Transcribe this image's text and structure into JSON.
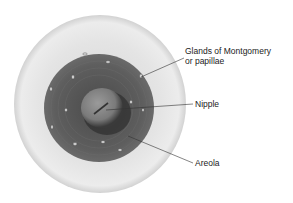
{
  "diagram": {
    "type": "anatomical-illustration",
    "labels": [
      {
        "id": "glands",
        "line1": "Glands of Montgomery",
        "line2": "or papillae"
      },
      {
        "id": "nipple",
        "text": "Nipple"
      },
      {
        "id": "areola",
        "text": "Areola"
      }
    ],
    "colors": {
      "background": "#ffffff",
      "skin": "#e6e6e6",
      "skin_edge": "#cfcfcf",
      "areola": "#5a5a5a",
      "nipple": "#7a7a7a",
      "leader_line": "#333333",
      "gland_spot": "#d8d8d8"
    }
  }
}
